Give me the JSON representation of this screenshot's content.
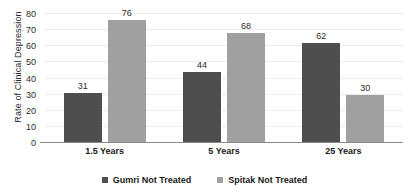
{
  "chart_data": {
    "type": "bar",
    "title": "",
    "subtitle": "",
    "xlabel": "",
    "ylabel": "Rate of Clinical Depression",
    "categories": [
      "1.5 Years",
      "5 Years",
      "25 Years"
    ],
    "series": [
      {
        "name": "Gumri Not Treated",
        "color": "#4e4e4e",
        "values": [
          31,
          44,
          62
        ]
      },
      {
        "name": "Spitak Not Treated",
        "color": "#a0a0a0",
        "values": [
          76,
          68,
          30
        ]
      }
    ],
    "ylim": [
      0,
      80
    ],
    "yticks": [
      0,
      10,
      20,
      30,
      40,
      50,
      60,
      70,
      80
    ],
    "ytick_labels": [
      "0",
      "10",
      "20",
      "30",
      "40",
      "50",
      "60",
      "70",
      "80"
    ],
    "grid": true,
    "grid_axis": "y",
    "legend_position": "bottom",
    "data_labels": [
      "31",
      "76",
      "44",
      "68",
      "62",
      "30"
    ]
  },
  "colors": {
    "series_dark": "#4e4e4e",
    "series_light": "#a0a0a0",
    "gridline": "#ececec",
    "axis": "#8a8a8a",
    "text": "#2b2b2b",
    "background": "#ffffff"
  }
}
